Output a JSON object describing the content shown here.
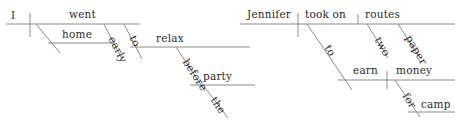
{
  "page": {
    "background_color": "#ffffff",
    "line_color": "#8a8a8a",
    "text_color": "#2b2b2b"
  },
  "diagrams": [
    {
      "id": "diagram-left",
      "sentence": "I went home early to relax before the party",
      "nodes": {
        "subject": "I",
        "verb": "went",
        "adverb_place": "home",
        "adverb_time": "early",
        "infinitive_marker": "to",
        "infinitive_verb": "relax",
        "preposition": "before",
        "object_of_preposition": "party",
        "article": "the"
      }
    },
    {
      "id": "diagram-right",
      "sentence": "Jennifer took on two paper routes to earn money for camp",
      "nodes": {
        "subject": "Jennifer",
        "verb": "took on",
        "direct_object": "routes",
        "modifier_number": "two",
        "modifier_noun": "paper",
        "infinitive_marker": "to",
        "infinitive_verb": "earn",
        "infinitive_object": "money",
        "preposition": "for",
        "object_of_preposition": "camp"
      }
    }
  ]
}
